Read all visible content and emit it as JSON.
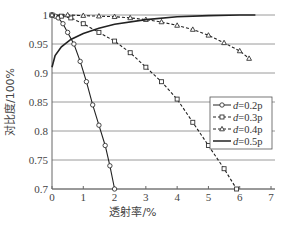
{
  "chart_data": {
    "type": "line",
    "title": "",
    "xlabel": "透射率/%",
    "ylabel": "对比度/100%",
    "xlim": [
      0,
      7
    ],
    "ylim": [
      0.7,
      1.0
    ],
    "xticks": [
      "0",
      "1",
      "2",
      "3",
      "4",
      "5",
      "6",
      "7"
    ],
    "yticks": [
      "1",
      "0.95",
      "0.9",
      "0.85",
      "0.8",
      "0.75",
      "0.7"
    ],
    "grid": "horizontal",
    "legend_position": "right-middle",
    "series": [
      {
        "name": "d=0.2p",
        "marker": "circle",
        "linestyle": "solid",
        "x": [
          0.0,
          0.1,
          0.2,
          0.35,
          0.5,
          0.7,
          0.9,
          1.1,
          1.3,
          1.5,
          1.7,
          1.85,
          2.0
        ],
        "y": [
          1.0,
          0.998,
          0.995,
          0.985,
          0.97,
          0.95,
          0.92,
          0.885,
          0.845,
          0.81,
          0.775,
          0.74,
          0.7
        ]
      },
      {
        "name": "d=0.3p",
        "marker": "square",
        "linestyle": "dashed",
        "x": [
          0.0,
          0.3,
          0.6,
          1.0,
          1.5,
          2.0,
          2.5,
          3.0,
          3.5,
          4.0,
          4.5,
          5.0,
          5.5,
          5.9
        ],
        "y": [
          1.0,
          0.998,
          0.995,
          0.985,
          0.97,
          0.955,
          0.935,
          0.91,
          0.885,
          0.855,
          0.815,
          0.775,
          0.735,
          0.7
        ]
      },
      {
        "name": "d=0.4p",
        "marker": "triangle",
        "linestyle": "dashed",
        "x": [
          0.0,
          0.5,
          1.0,
          1.5,
          2.0,
          2.5,
          3.0,
          3.5,
          4.0,
          4.5,
          5.0,
          5.5,
          6.0,
          6.3
        ],
        "y": [
          1.0,
          1.0,
          0.999,
          0.998,
          0.997,
          0.995,
          0.992,
          0.988,
          0.982,
          0.975,
          0.965,
          0.952,
          0.938,
          0.925
        ]
      },
      {
        "name": "d=0.5p",
        "marker": "none",
        "linestyle": "solid",
        "x": [
          0.0,
          0.1,
          0.3,
          0.6,
          1.0,
          1.5,
          2.0,
          3.0,
          4.0,
          5.0,
          6.0,
          6.5
        ],
        "y": [
          0.91,
          0.93,
          0.945,
          0.958,
          0.968,
          0.977,
          0.984,
          0.992,
          0.997,
          0.999,
          1.0,
          1.0
        ]
      }
    ]
  }
}
